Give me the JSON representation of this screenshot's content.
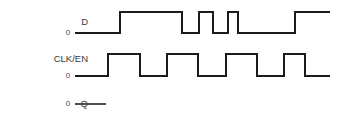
{
  "diagram": {
    "background_color": "#ffffff",
    "wave_color": "#1c1c1c",
    "label_color": "#3a3a3a",
    "width": 348,
    "height": 122
  },
  "signals": [
    {
      "name": "D",
      "label_x": 88,
      "label_y": 22,
      "level_label": "0",
      "level_label_x": 68,
      "level_label_y": 33,
      "low_y": 33,
      "high_y": 12,
      "start_x": 75,
      "end_x": 330,
      "transitions": [
        120,
        182,
        199,
        213,
        228,
        238,
        295
      ],
      "initial_level": "low"
    },
    {
      "name": "CLK/EN",
      "label_x": 88,
      "label_y": 59,
      "level_label": "0",
      "level_label_x": 68,
      "level_label_y": 76,
      "low_y": 76,
      "high_y": 54,
      "start_x": 75,
      "end_x": 330,
      "transitions": [
        108,
        140,
        167,
        198,
        226,
        257,
        284,
        305
      ],
      "initial_level": "low"
    },
    {
      "name": "Q",
      "label_x": 88,
      "label_y": 104,
      "level_label": "0",
      "level_label_x": 68,
      "level_label_y": 104,
      "low_y": 104,
      "high_y": 104,
      "start_x": 75,
      "end_x": 106,
      "transitions": [],
      "initial_level": "low",
      "thin": true
    }
  ],
  "chart_data": {
    "type": "line",
    "xlabel": "",
    "ylabel": "",
    "series": [
      {
        "name": "D",
        "level_marker": "0",
        "edges": [
          {
            "x": 75,
            "level": 0
          },
          {
            "x": 120,
            "level": 1
          },
          {
            "x": 182,
            "level": 0
          },
          {
            "x": 199,
            "level": 1
          },
          {
            "x": 213,
            "level": 0
          },
          {
            "x": 228,
            "level": 1
          },
          {
            "x": 238,
            "level": 0
          },
          {
            "x": 295,
            "level": 1
          },
          {
            "x": 330,
            "level": 0
          }
        ],
        "pulse_count": 4,
        "description": "Data input: low, long high pulse, short low, short high, narrow low notch, long high, returns low"
      },
      {
        "name": "CLK/EN",
        "level_marker": "0",
        "edges": [
          {
            "x": 75,
            "level": 0
          },
          {
            "x": 108,
            "level": 1
          },
          {
            "x": 140,
            "level": 0
          },
          {
            "x": 167,
            "level": 1
          },
          {
            "x": 198,
            "level": 0
          },
          {
            "x": 226,
            "level": 1
          },
          {
            "x": 257,
            "level": 0
          },
          {
            "x": 284,
            "level": 1
          },
          {
            "x": 305,
            "level": 0
          },
          {
            "x": 330,
            "level": 0
          }
        ],
        "pulse_count": 4,
        "description": "Clock/enable: four regular high pulses then low"
      },
      {
        "name": "Q",
        "level_marker": "0",
        "edges": [
          {
            "x": 75,
            "level": 0
          },
          {
            "x": 106,
            "level": 0
          }
        ],
        "pulse_count": 0,
        "description": "Output: short low stub only, waveform not drawn"
      }
    ],
    "legend_position": "left-labels",
    "grid": false
  }
}
